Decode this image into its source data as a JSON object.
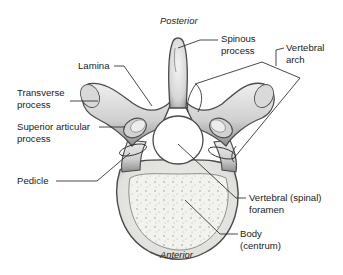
{
  "diagram": {
    "orientation": {
      "top": "Posterior",
      "bottom": "Anterior"
    },
    "labels": {
      "spinous_process": {
        "line1": "Spinous",
        "line2": "process"
      },
      "vertebral_arch": {
        "line1": "Vertebral",
        "line2": "arch"
      },
      "lamina": {
        "line1": "Lamina"
      },
      "transverse_process": {
        "line1": "Transverse",
        "line2": "process"
      },
      "superior_articular_process": {
        "line1": "Superior articular",
        "line2": "process"
      },
      "pedicle": {
        "line1": "Pedicle"
      },
      "vertebral_foramen": {
        "line1": "Vertebral (spinal)",
        "line2": "foramen"
      },
      "body": {
        "line1": "Body",
        "line2": "(centrum)"
      }
    },
    "colors": {
      "bone_fill": "#e4e4e4",
      "bone_shade": "#9a9a9a",
      "bone_outline": "#4a4a4a",
      "leader_line": "#333333",
      "background": "#ffffff"
    }
  }
}
